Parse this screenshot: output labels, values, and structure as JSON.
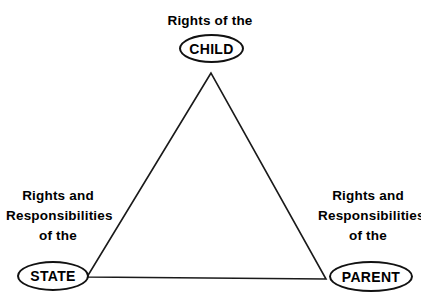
{
  "diagram": {
    "type": "triangle-relationship",
    "background_color": "#ffffff",
    "line_color": "#1a1a1a",
    "text_color": "#000000",
    "nodes": [
      {
        "id": "child",
        "position": "top",
        "caption_lines": [
          "Rights of the"
        ],
        "label": "CHILD",
        "shape": "ellipse"
      },
      {
        "id": "state",
        "position": "bottom-left",
        "caption_lines": [
          "Rights and",
          "Responsibilities",
          "of the"
        ],
        "label": "STATE",
        "shape": "ellipse"
      },
      {
        "id": "parent",
        "position": "bottom-right",
        "caption_lines": [
          "Rights and",
          "Responsibilities",
          "of the"
        ],
        "label": "PARENT",
        "shape": "ellipse"
      }
    ]
  }
}
